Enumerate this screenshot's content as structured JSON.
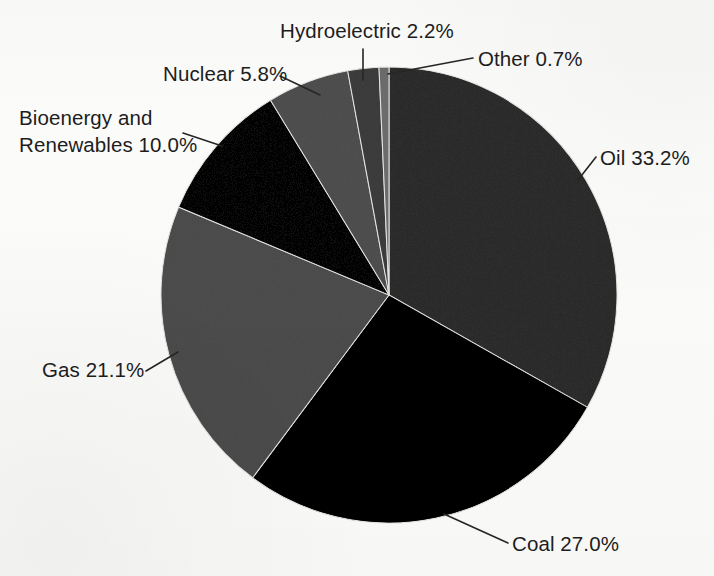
{
  "figure": {
    "background_color": "#fbfbfa",
    "text_color": "#1d1d1d",
    "leader_line_color": "#262626"
  },
  "chart_data": {
    "type": "pie",
    "title": "",
    "subtitle": "",
    "xlabel": "",
    "ylabel": "",
    "legend_position": "none",
    "grid": false,
    "units": "percent",
    "start_angle_deg": 0,
    "direction": "clockwise",
    "categories": [
      "Oil",
      "Coal",
      "Gas",
      "Bioenergy and Renewables",
      "Nuclear",
      "Hydroelectric",
      "Other"
    ],
    "values": [
      33.2,
      27.0,
      21.1,
      10.0,
      5.8,
      2.2,
      0.7
    ],
    "colors": [
      "#6b6b6b",
      "#1c1c1c",
      "#8b8b8b",
      "#303030",
      "#8d8d8d",
      "#7c7c7c",
      "#a6a6a6"
    ],
    "slices": [
      {
        "name": "Oil",
        "value": 33.2,
        "label": "Oil 33.2%",
        "color": "#6b6b6b"
      },
      {
        "name": "Coal",
        "value": 27.0,
        "label": "Coal 27.0%",
        "color": "#1c1c1c"
      },
      {
        "name": "Gas",
        "value": 21.1,
        "label": "Gas 21.1%",
        "color": "#8b8b8b"
      },
      {
        "name": "Bioenergy and Renewables",
        "value": 10.0,
        "label": "Bioenergy and\nRenewables 10.0%",
        "color": "#303030"
      },
      {
        "name": "Nuclear",
        "value": 5.8,
        "label": "Nuclear 5.8%",
        "color": "#8d8d8d"
      },
      {
        "name": "Hydroelectric",
        "value": 2.2,
        "label": "Hydroelectric 2.2%",
        "color": "#7c7c7c"
      },
      {
        "name": "Other",
        "value": 0.7,
        "label": "Other 0.7%",
        "color": "#a6a6a6"
      }
    ]
  },
  "labels": {
    "hydroelectric": "Hydroelectric 2.2%",
    "other": "Other 0.7%",
    "nuclear": "Nuclear 5.8%",
    "bioenergy_line1": "Bioenergy and",
    "bioenergy_line2": "Renewables 10.0%",
    "oil": "Oil 33.2%",
    "gas": "Gas 21.1%",
    "coal": "Coal 27.0%"
  }
}
